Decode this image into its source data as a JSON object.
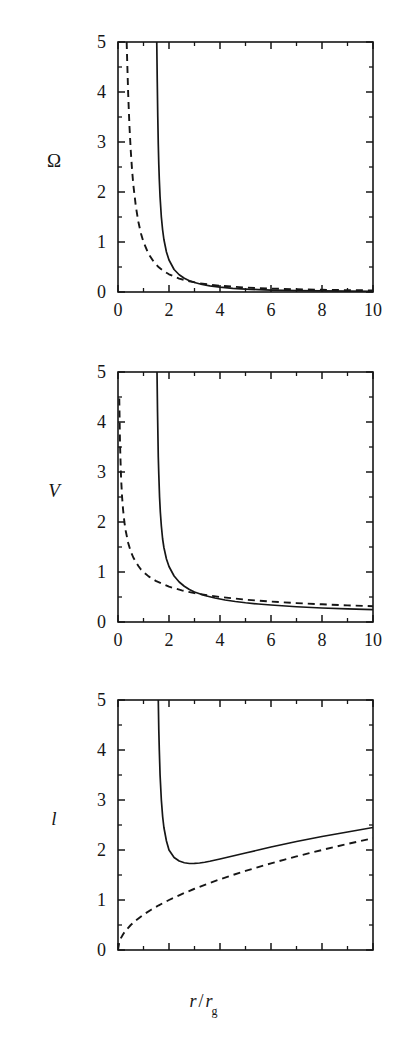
{
  "figure": {
    "panels": [
      {
        "id": "panel-omega",
        "ylabel": "Ω",
        "ylabel_italic": false,
        "xticklabels": [
          "0",
          "2",
          "4",
          "6",
          "8",
          "10"
        ],
        "yticklabels": [
          "0",
          "1",
          "2",
          "3",
          "4",
          "5"
        ]
      },
      {
        "id": "panel-v",
        "ylabel": "V",
        "ylabel_italic": true,
        "xticklabels": [
          "0",
          "2",
          "4",
          "6",
          "8",
          "10"
        ],
        "yticklabels": [
          "0",
          "1",
          "2",
          "3",
          "4",
          "5"
        ]
      },
      {
        "id": "panel-l",
        "ylabel": "l",
        "ylabel_italic": true,
        "xticklabels": [
          "0",
          "2",
          "4",
          "6",
          "8",
          "10"
        ],
        "yticklabels": [
          "0",
          "1",
          "2",
          "3",
          "4",
          "5"
        ]
      }
    ],
    "xlabel_main": "r",
    "xlabel_slash": "/",
    "xlabel_denom": "r",
    "xlabel_denom_sub": "g",
    "line_color": "#161616"
  },
  "chart_data": [
    {
      "type": "line",
      "title": "",
      "xlabel": "r / r_g",
      "ylabel": "Ω",
      "xlim": [
        0,
        10
      ],
      "ylim": [
        0,
        5
      ],
      "xticks": [
        0,
        2,
        4,
        6,
        8,
        10
      ],
      "yticks": [
        0,
        1,
        2,
        3,
        4,
        5
      ],
      "minor_xticks": [
        1,
        3,
        5,
        7,
        9
      ],
      "minor_yticks": [
        0.5,
        1.5,
        2.5,
        3.5,
        4.5
      ],
      "grid": false,
      "legend": null,
      "series": [
        {
          "name": "relativistic",
          "style": "solid",
          "x": [
            1.52,
            1.54,
            1.56,
            1.58,
            1.6,
            1.62,
            1.65,
            1.7,
            1.75,
            1.8,
            1.9,
            2.0,
            2.2,
            2.4,
            2.6,
            2.8,
            3.0,
            3.3,
            3.6,
            4.0,
            4.5,
            5.0,
            5.5,
            6.0,
            7.0,
            8.0,
            9.0,
            10.0
          ],
          "y": [
            5.0,
            4.2,
            3.5,
            2.95,
            2.55,
            2.25,
            1.9,
            1.5,
            1.24,
            1.05,
            0.8,
            0.64,
            0.45,
            0.345,
            0.275,
            0.225,
            0.19,
            0.15,
            0.123,
            0.098,
            0.074,
            0.058,
            0.047,
            0.039,
            0.029,
            0.022,
            0.017,
            0.014
          ]
        },
        {
          "name": "newtonian",
          "style": "dashed",
          "x": [
            0.34,
            0.36,
            0.4,
            0.45,
            0.5,
            0.55,
            0.6,
            0.7,
            0.8,
            0.9,
            1.0,
            1.2,
            1.4,
            1.6,
            1.8,
            2.0,
            2.4,
            2.8,
            3.2,
            3.6,
            4.0,
            5.0,
            6.0,
            7.0,
            8.0,
            9.0,
            10.0
          ],
          "y": [
            5.0,
            4.63,
            3.95,
            3.31,
            2.83,
            2.45,
            2.15,
            1.71,
            1.4,
            1.17,
            1.0,
            0.76,
            0.604,
            0.494,
            0.414,
            0.354,
            0.269,
            0.214,
            0.175,
            0.146,
            0.125,
            0.089,
            0.068,
            0.054,
            0.044,
            0.037,
            0.032
          ]
        }
      ]
    },
    {
      "type": "line",
      "title": "",
      "xlabel": "r / r_g",
      "ylabel": "V",
      "xlim": [
        0,
        10
      ],
      "ylim": [
        0,
        5
      ],
      "xticks": [
        0,
        2,
        4,
        6,
        8,
        10
      ],
      "yticks": [
        0,
        1,
        2,
        3,
        4,
        5
      ],
      "minor_xticks": [
        1,
        3,
        5,
        7,
        9
      ],
      "minor_yticks": [
        0.5,
        1.5,
        2.5,
        3.5,
        4.5
      ],
      "grid": false,
      "legend": null,
      "series": [
        {
          "name": "relativistic",
          "style": "solid",
          "x": [
            1.53,
            1.55,
            1.58,
            1.6,
            1.63,
            1.66,
            1.7,
            1.75,
            1.8,
            1.9,
            2.0,
            2.2,
            2.4,
            2.6,
            2.8,
            3.0,
            3.4,
            3.8,
            4.2,
            4.6,
            5.0,
            5.5,
            6.0,
            7.0,
            8.0,
            9.0,
            10.0
          ],
          "y": [
            5.0,
            4.2,
            3.3,
            2.95,
            2.5,
            2.2,
            1.92,
            1.66,
            1.49,
            1.26,
            1.11,
            0.92,
            0.8,
            0.715,
            0.65,
            0.6,
            0.53,
            0.48,
            0.44,
            0.41,
            0.385,
            0.36,
            0.34,
            0.305,
            0.28,
            0.262,
            0.248
          ]
        },
        {
          "name": "newtonian",
          "style": "dashed",
          "x": [
            0.05,
            0.08,
            0.12,
            0.16,
            0.2,
            0.25,
            0.3,
            0.4,
            0.5,
            0.6,
            0.7,
            0.8,
            0.9,
            1.0,
            1.2,
            1.5,
            2.0,
            2.5,
            3.0,
            3.5,
            4.0,
            5.0,
            6.0,
            7.0,
            8.0,
            9.0,
            10.0
          ],
          "y": [
            4.47,
            3.54,
            2.89,
            2.5,
            2.24,
            2.0,
            1.83,
            1.58,
            1.41,
            1.29,
            1.2,
            1.12,
            1.05,
            1.0,
            0.913,
            0.816,
            0.707,
            0.632,
            0.577,
            0.535,
            0.5,
            0.447,
            0.408,
            0.378,
            0.354,
            0.333,
            0.316
          ]
        }
      ]
    },
    {
      "type": "line",
      "title": "",
      "xlabel": "r / r_g",
      "ylabel": "l",
      "xlim": [
        0,
        10
      ],
      "ylim": [
        0,
        5
      ],
      "xticks": [
        0,
        2,
        4,
        6,
        8,
        10
      ],
      "yticks": [
        0,
        1,
        2,
        3,
        4,
        5
      ],
      "minor_xticks": [
        1,
        3,
        5,
        7,
        9
      ],
      "minor_yticks": [
        0.5,
        1.5,
        2.5,
        3.5,
        4.5
      ],
      "grid": false,
      "legend": null,
      "series": [
        {
          "name": "relativistic",
          "style": "solid",
          "x": [
            1.58,
            1.6,
            1.62,
            1.65,
            1.7,
            1.75,
            1.8,
            1.9,
            2.0,
            2.2,
            2.4,
            2.6,
            2.8,
            3.0,
            3.2,
            3.4,
            3.6,
            4.0,
            4.5,
            5.0,
            5.5,
            6.0,
            7.0,
            8.0,
            9.0,
            10.0
          ],
          "y": [
            5.0,
            4.4,
            4.0,
            3.5,
            3.0,
            2.67,
            2.45,
            2.18,
            2.0,
            1.85,
            1.78,
            1.745,
            1.73,
            1.732,
            1.74,
            1.755,
            1.775,
            1.82,
            1.88,
            1.94,
            2.0,
            2.06,
            2.17,
            2.27,
            2.36,
            2.45
          ]
        },
        {
          "name": "newtonian",
          "style": "dashed",
          "x": [
            0.0,
            0.05,
            0.1,
            0.2,
            0.3,
            0.5,
            0.7,
            1.0,
            1.3,
            1.6,
            2.0,
            2.5,
            3.0,
            3.5,
            4.0,
            4.5,
            5.0,
            5.5,
            6.0,
            6.5,
            7.0,
            7.5,
            8.0,
            8.5,
            9.0,
            9.5,
            10.0
          ],
          "y": [
            0.0,
            0.158,
            0.224,
            0.316,
            0.387,
            0.5,
            0.592,
            0.707,
            0.806,
            0.894,
            1.0,
            1.118,
            1.225,
            1.323,
            1.414,
            1.5,
            1.581,
            1.658,
            1.732,
            1.803,
            1.871,
            1.936,
            2.0,
            2.062,
            2.121,
            2.179,
            2.236
          ]
        }
      ]
    }
  ]
}
